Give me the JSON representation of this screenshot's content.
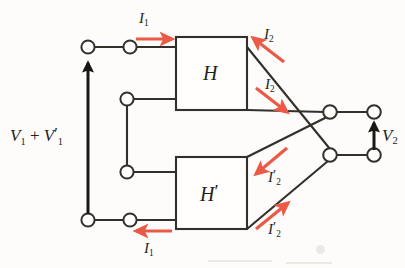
{
  "figure": {
    "kind": "circuit-diagram",
    "colors": {
      "wire": "#332f2b",
      "arrow_current": "#ea5a47",
      "arrow_voltage": "#1a1613",
      "background": "#fdfcfa",
      "text": "#221f1d"
    }
  },
  "blocks": [
    {
      "id": "block-h",
      "label": "H",
      "prime": false
    },
    {
      "id": "block-h-prime",
      "label": "H",
      "prime": true
    }
  ],
  "labels": {
    "input_voltage": {
      "v": "V",
      "sub1": "1",
      "plus": " + ",
      "v2": "V",
      "sub2": "1",
      "prime": "′"
    },
    "output_voltage": {
      "v": "V",
      "sub": "2"
    },
    "current_top_input": {
      "i": "I",
      "sub": "1"
    },
    "current_bottom_input": {
      "i": "I",
      "sub": "1"
    },
    "current_h_upper": {
      "i": "I",
      "sub": "2"
    },
    "current_h_lower": {
      "i": "I",
      "sub": "2"
    },
    "current_hp_upper": {
      "i": "I",
      "sub": "2",
      "prime": "′"
    },
    "current_hp_lower": {
      "i": "I",
      "sub": "2",
      "prime": "′"
    }
  },
  "terminals": [
    {
      "name": "input-top-outer",
      "x": 88,
      "y": 47
    },
    {
      "name": "input-top-inner",
      "x": 130,
      "y": 47
    },
    {
      "name": "mid-upper",
      "x": 127,
      "y": 99
    },
    {
      "name": "mid-lower",
      "x": 127,
      "y": 172
    },
    {
      "name": "input-bottom-outer",
      "x": 88,
      "y": 220
    },
    {
      "name": "input-bottom-inner",
      "x": 130,
      "y": 220
    },
    {
      "name": "output-inner-top",
      "x": 330,
      "y": 112
    },
    {
      "name": "output-inner-bottom",
      "x": 330,
      "y": 155
    },
    {
      "name": "output-outer-top",
      "x": 374,
      "y": 112
    },
    {
      "name": "output-outer-bottom",
      "x": 374,
      "y": 155
    }
  ],
  "current_arrows": [
    {
      "name": "arrow-i1-top",
      "direction": "right",
      "label": "I1"
    },
    {
      "name": "arrow-i1-bottom",
      "direction": "left",
      "label": "I1"
    },
    {
      "name": "arrow-i2-upper",
      "direction": "up-left",
      "label": "I2"
    },
    {
      "name": "arrow-i2-lower",
      "direction": "down-right",
      "label": "I2"
    },
    {
      "name": "arrow-i2prime-upper",
      "direction": "down-left",
      "label": "I2prime"
    },
    {
      "name": "arrow-i2prime-lower",
      "direction": "up-right",
      "label": "I2prime"
    }
  ],
  "voltage_arrows": [
    {
      "name": "arrow-v1-sum",
      "direction": "up",
      "label": "V1 + V1prime"
    },
    {
      "name": "arrow-v2",
      "direction": "up",
      "label": "V2"
    }
  ]
}
